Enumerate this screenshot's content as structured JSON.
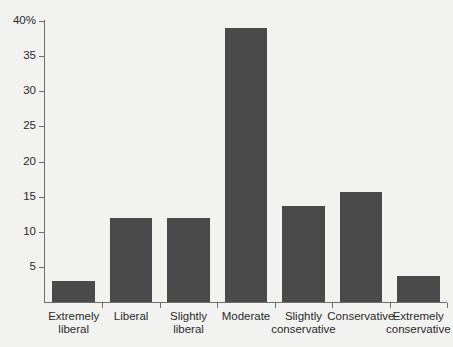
{
  "chart_data": {
    "type": "bar",
    "title": "",
    "xlabel": "",
    "ylabel": "",
    "categories": [
      "Extremely liberal",
      "Liberal",
      "Slightly liberal",
      "Moderate",
      "Slightly conservative",
      "Conservative",
      "Extremely conservative"
    ],
    "category_lines": [
      [
        "Extremely",
        "liberal"
      ],
      [
        "Liberal",
        ""
      ],
      [
        "Slightly",
        "liberal"
      ],
      [
        "Moderate",
        ""
      ],
      [
        "Slightly",
        "conservative"
      ],
      [
        "Conservative",
        ""
      ],
      [
        "Extremely",
        "conservative"
      ]
    ],
    "values": [
      3.0,
      12.0,
      12.0,
      39.0,
      13.7,
      15.7,
      3.7
    ],
    "ylim": [
      0,
      40
    ],
    "yticks": [
      0,
      5,
      10,
      15,
      20,
      25,
      30,
      35,
      40
    ],
    "ytick_labels": [
      "",
      "5",
      "10",
      "15",
      "20",
      "25",
      "30",
      "35",
      "40%"
    ],
    "grid": false,
    "legend": false,
    "bar_color": "#4a4a4a",
    "axis_color": "#6e6e6e",
    "background_color": "#f2f2f0",
    "text_color": "#2b2b2b"
  },
  "title_remnant": ""
}
